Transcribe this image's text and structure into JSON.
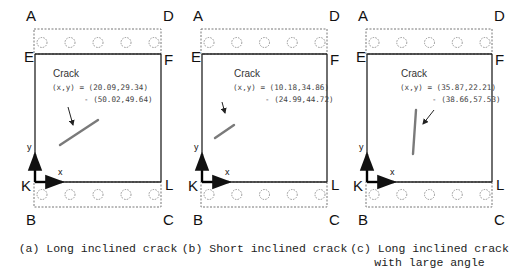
{
  "panels": [
    {
      "id": "a",
      "x0": 35,
      "x1": 161,
      "corners": {
        "A": "A",
        "D": "D",
        "E": "E",
        "F": "F",
        "K": "K",
        "L": "L",
        "B": "B",
        "C": "C"
      },
      "crack_title": "Crack",
      "coord_line1": "(x,y) = (20.09,29.34)",
      "coord_line2": "- (50.02,49.64)",
      "crack": {
        "x1": 60,
        "y1": 145,
        "x2": 98,
        "y2": 120
      },
      "arrow": {
        "x1": 68,
        "y1": 107,
        "x2": 73,
        "y2": 125
      },
      "text_x": 52,
      "axis_x": "x",
      "axis_y": "y",
      "caption": [
        "(a) Long inclined crack"
      ]
    },
    {
      "id": "b",
      "x0": 202,
      "x1": 327,
      "corners": {
        "A": "A",
        "D": "D",
        "E": "E",
        "F": "F",
        "K": "K",
        "L": "L",
        "B": "B",
        "C": "C"
      },
      "crack_title": "Crack",
      "coord_line1": "(x,y) = (10.18,34.86)",
      "coord_line2": "- (24.99,44.72)",
      "crack": {
        "x1": 215,
        "y1": 138,
        "x2": 234,
        "y2": 125
      },
      "arrow": {
        "x1": 222,
        "y1": 102,
        "x2": 225,
        "y2": 113
      },
      "text_x": 233,
      "axis_x": "x",
      "axis_y": "y",
      "caption": [
        "(b) Short inclined crack"
      ]
    },
    {
      "id": "c",
      "x0": 367,
      "x1": 492,
      "corners": {
        "A": "A",
        "D": "D",
        "E": "E",
        "F": "F",
        "K": "K",
        "L": "L",
        "B": "B",
        "C": "C"
      },
      "crack_title": "Crack",
      "coord_line1": "(x,y) = (35.87,22.21)",
      "coord_line2": "- (38.66,57.53)",
      "crack": {
        "x1": 413,
        "y1": 154,
        "x2": 416,
        "y2": 110
      },
      "arrow": {
        "x1": 434,
        "y1": 110,
        "x2": 423,
        "y2": 124
      },
      "text_x": 400,
      "axis_x": "x",
      "axis_y": "y",
      "caption": [
        "(c) Long inclined crack",
        "with large angle"
      ]
    }
  ],
  "layout": {
    "top_dash_y": 29,
    "ef_y": 54,
    "kl_y": 182,
    "bottom_dash_y": 207,
    "colors": {
      "line": "#222222",
      "dash": "#777777",
      "crack": "#7a7a7a"
    }
  }
}
